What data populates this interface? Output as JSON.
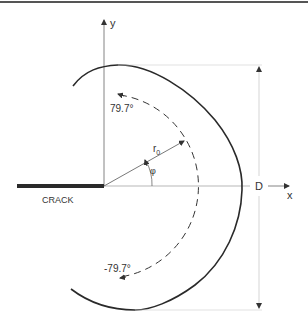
{
  "diagram": {
    "labels": {
      "y_axis": "y",
      "x_axis": "x",
      "crack": "CRACK",
      "radius": "r",
      "radius_subscript": "0",
      "angle": "φ",
      "upper_angle": "79.7°",
      "lower_angle": "-79.7°",
      "dimension": "D"
    },
    "colors": {
      "stroke": "#2a2a2a",
      "thin": "#555555",
      "faint": "#bbbbbb",
      "text": "#333333"
    }
  }
}
